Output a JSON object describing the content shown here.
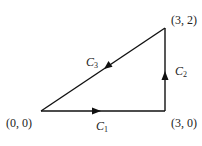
{
  "diagram": {
    "type": "closed-path-triangle",
    "vertices": [
      {
        "id": "origin",
        "label": "(0, 0)"
      },
      {
        "id": "bottom-right",
        "label": "(3, 0)"
      },
      {
        "id": "top-right",
        "label": "(3, 2)"
      }
    ],
    "curves": [
      {
        "id": "C1",
        "name": "C",
        "sub": "1",
        "from": "(0, 0)",
        "to": "(3, 0)"
      },
      {
        "id": "C2",
        "name": "C",
        "sub": "2",
        "from": "(3, 0)",
        "to": "(3, 2)"
      },
      {
        "id": "C3",
        "name": "C",
        "sub": "3",
        "from": "(3, 2)",
        "to": "(0, 0)"
      }
    ],
    "colors": {
      "stroke": "#111111",
      "text": "#222222"
    }
  }
}
